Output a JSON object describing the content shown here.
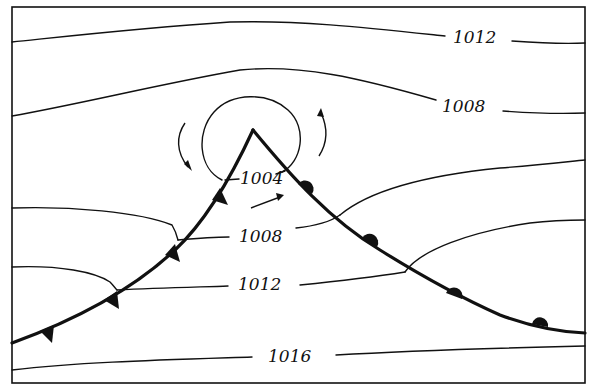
{
  "diagram": {
    "type": "weather-map",
    "isobars": [
      {
        "value": "1004",
        "shape": "closed loop around low center"
      },
      {
        "value": "1008",
        "label_positions": [
          "upper right",
          "warm sector center"
        ]
      },
      {
        "value": "1012",
        "label_positions": [
          "top right",
          "warm sector lower"
        ]
      },
      {
        "value": "1016",
        "label_positions": [
          "bottom"
        ]
      }
    ],
    "labels": {
      "top_1012": "1012",
      "upper_1008": "1008",
      "center_1004": "1004",
      "sector_1008": "1008",
      "sector_1012": "1012",
      "bottom_1016": "1016"
    },
    "fronts": [
      {
        "name": "cold front",
        "symbol": "triangles",
        "count": 5,
        "direction": "from low center toward lower-left"
      },
      {
        "name": "warm front",
        "symbol": "semicircles",
        "count": 4,
        "direction": "from low center toward lower-right"
      }
    ],
    "arrows": [
      {
        "meaning": "counterclockwise circulation",
        "position": "left of low",
        "direction": "downward"
      },
      {
        "meaning": "counterclockwise circulation",
        "position": "right of low",
        "direction": "upward"
      },
      {
        "meaning": "warm sector flow",
        "position": "inside warm sector",
        "direction": "northeast"
      }
    ],
    "colors": {
      "ink": "#111111",
      "background": "#ffffff"
    }
  }
}
